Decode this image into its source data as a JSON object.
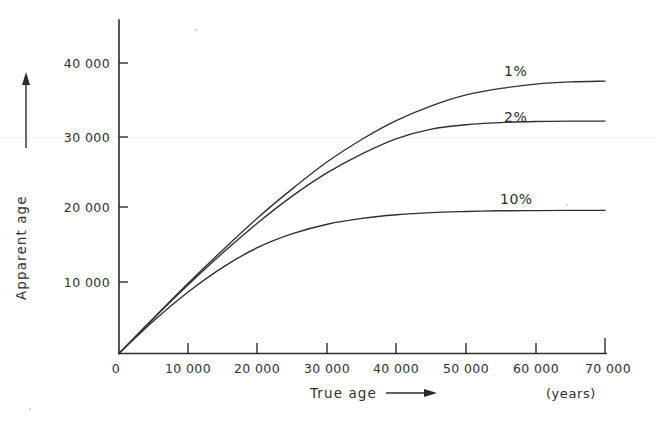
{
  "figure": {
    "name": "apparent-age-vs-true-age",
    "background_color": "#ffffff",
    "ink_color": "#2f2f2f"
  },
  "axes": {
    "y": {
      "title": "Apparent age",
      "arrow": "up-arrow",
      "ticks": [
        "0",
        "10 000",
        "20 000",
        "30 000",
        "40 000"
      ],
      "tick_values": [
        0,
        10000,
        20000,
        30000,
        40000
      ],
      "range": [
        0,
        40000
      ],
      "origin_label": "0"
    },
    "x": {
      "title": "True age",
      "arrow": "right-arrow",
      "units": "(years)",
      "ticks": [
        "0",
        "10 000",
        "20 000",
        "30 000",
        "40 000",
        "50 000",
        "60 000",
        "70 000"
      ],
      "tick_values": [
        0,
        10000,
        20000,
        30000,
        40000,
        50000,
        60000,
        70000
      ],
      "range": [
        0,
        70000
      ]
    }
  },
  "series_labels": {
    "one_percent": "1%",
    "two_percent": "2%",
    "ten_percent": "10%"
  },
  "chart_data": {
    "type": "line",
    "title": "",
    "xlabel": "True age",
    "ylabel": "Apparent age",
    "xlim": [
      0,
      70000
    ],
    "ylim": [
      0,
      40000
    ],
    "xunits": "(years)",
    "yunits": "years",
    "grid": false,
    "legend": "inline-curve-labels",
    "x": [
      0,
      5000,
      10000,
      15000,
      20000,
      25000,
      30000,
      35000,
      40000,
      45000,
      50000,
      55000,
      60000,
      65000,
      70000
    ],
    "series": [
      {
        "name": "1%",
        "label": "1%",
        "contamination_percent": 1,
        "values": [
          0,
          4900,
          9700,
          14300,
          18700,
          22700,
          26400,
          29500,
          32100,
          34100,
          35600,
          36500,
          37100,
          37400,
          37500
        ],
        "asymptote": 37500,
        "label_position": {
          "x": 55000,
          "y": 39000
        }
      },
      {
        "name": "2%",
        "label": "2%",
        "contamination_percent": 2,
        "values": [
          0,
          4850,
          9500,
          13900,
          18000,
          21700,
          24900,
          27500,
          29600,
          30900,
          31500,
          31800,
          31950,
          32000,
          32000
        ],
        "asymptote": 32000,
        "label_position": {
          "x": 55000,
          "y": 33800
        }
      },
      {
        "name": "10%",
        "label": "10%",
        "contamination_percent": 10,
        "values": [
          0,
          4500,
          8500,
          11900,
          14600,
          16500,
          17800,
          18600,
          19100,
          19400,
          19550,
          19650,
          19680,
          19700,
          19700
        ],
        "asymptote": 19700,
        "label_position": {
          "x": 55000,
          "y": 22600
        }
      }
    ]
  }
}
